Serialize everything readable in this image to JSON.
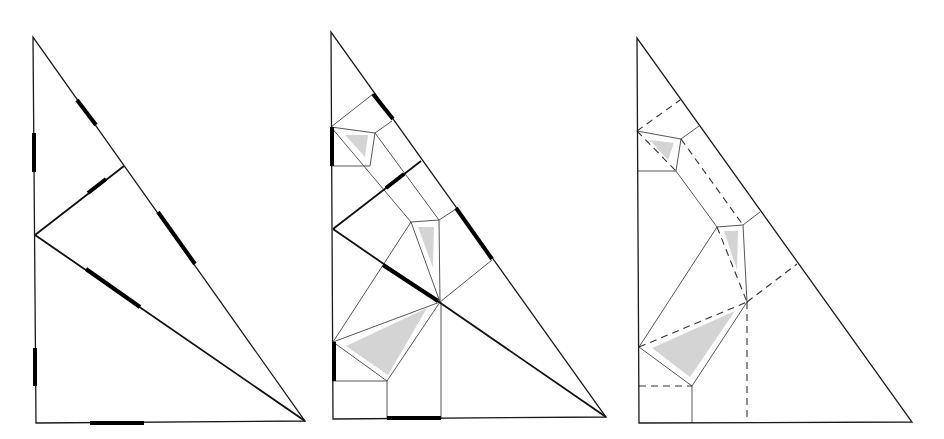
{
  "figure": {
    "colors": {
      "line": "#1a1a1a",
      "mark": "#000000",
      "shade": "#cfcfcf",
      "background": "#ffffff"
    },
    "panels": [
      {
        "id": "panel-1",
        "outline": [
          [
            33,
            37
          ],
          [
            36,
            423
          ],
          [
            305,
            421
          ]
        ],
        "edges": [
          [
            [
              35,
              235
            ],
            [
              124,
              166
            ]
          ],
          [
            [
              35,
              235
            ],
            [
              305,
              421
            ]
          ]
        ],
        "marks": [
          [
            [
              34,
              133
            ],
            [
              34,
              172
            ]
          ],
          [
            [
              35,
              348
            ],
            [
              35,
              386
            ]
          ],
          [
            [
              77,
              100
            ],
            [
              96,
              125
            ]
          ],
          [
            [
              158,
              212
            ],
            [
              195,
              264
            ]
          ],
          [
            [
              88,
              193
            ],
            [
              106,
              179
            ]
          ],
          [
            [
              86,
              269
            ],
            [
              140,
              307
            ]
          ],
          [
            [
              90,
              423
            ],
            [
              144,
              423
            ]
          ]
        ],
        "shades": [],
        "dashes": [],
        "creases": []
      },
      {
        "id": "panel-2",
        "outline": [
          [
            331,
            32
          ],
          [
            333,
            419
          ],
          [
            606,
            417
          ]
        ],
        "edges": [
          [
            [
              333,
              229
            ],
            [
              421,
              161
            ]
          ],
          [
            [
              333,
              229
            ],
            [
              606,
              417
            ]
          ]
        ],
        "creases": [
          [
            [
              331,
              127
            ],
            [
              373,
              94
            ]
          ],
          [
            [
              331,
              127
            ],
            [
              375,
              133
            ]
          ],
          [
            [
              375,
              133
            ],
            [
              370,
              166
            ]
          ],
          [
            [
              370,
              166
            ],
            [
              332,
              166
            ]
          ],
          [
            [
              375,
              133
            ],
            [
              392,
              121
            ]
          ],
          [
            [
              331,
              127
            ],
            [
              411,
              222
            ]
          ],
          [
            [
              375,
              133
            ],
            [
              439,
              220
            ]
          ],
          [
            [
              411,
              222
            ],
            [
              439,
              220
            ]
          ],
          [
            [
              439,
              220
            ],
            [
              440,
              302
            ]
          ],
          [
            [
              411,
              222
            ],
            [
              440,
              302
            ]
          ],
          [
            [
              439,
              220
            ],
            [
              456,
              209
            ]
          ],
          [
            [
              492,
              260
            ],
            [
              440,
              302
            ]
          ],
          [
            [
              411,
              222
            ],
            [
              333,
              342
            ]
          ],
          [
            [
              333,
              342
            ],
            [
              440,
              302
            ]
          ],
          [
            [
              333,
              342
            ],
            [
              387,
              381
            ]
          ],
          [
            [
              387,
              381
            ],
            [
              440,
              302
            ]
          ],
          [
            [
              333,
              381
            ],
            [
              387,
              381
            ]
          ],
          [
            [
              387,
              381
            ],
            [
              387,
              419
            ]
          ],
          [
            [
              441,
              302
            ],
            [
              441,
              419
            ]
          ]
        ],
        "marks": [
          [
            [
              373,
              94
            ],
            [
              393,
              119
            ]
          ],
          [
            [
              332,
              127
            ],
            [
              332,
              166
            ]
          ],
          [
            [
              386,
              188
            ],
            [
              404,
              174
            ]
          ],
          [
            [
              456,
              208
            ],
            [
              492,
              259
            ]
          ],
          [
            [
              383,
              265
            ],
            [
              438,
              301
            ]
          ],
          [
            [
              334,
              342
            ],
            [
              334,
              381
            ]
          ],
          [
            [
              387,
              418
            ],
            [
              441,
              418
            ]
          ]
        ],
        "shades": [
          [
            [
              345,
              135
            ],
            [
              368,
              135
            ],
            [
              365,
              157
            ]
          ],
          [
            [
              418,
              227
            ],
            [
              434,
              227
            ],
            [
              433,
              268
            ]
          ],
          [
            [
              346,
              346
            ],
            [
              427,
              308
            ],
            [
              388,
              375
            ]
          ]
        ],
        "dashes": []
      },
      {
        "id": "panel-3",
        "outline": [
          [
            637,
            38
          ],
          [
            639,
            423
          ],
          [
            912,
            422
          ]
        ],
        "edges": [],
        "creases": [
          [
            [
              637,
              131
            ],
            [
              681,
              139
            ]
          ],
          [
            [
              681,
              139
            ],
            [
              676,
              171
            ]
          ],
          [
            [
              676,
              171
            ],
            [
              637,
              171
            ]
          ],
          [
            [
              681,
              139
            ],
            [
              699,
              126
            ]
          ],
          [
            [
              676,
              171
            ],
            [
              717,
              227
            ]
          ],
          [
            [
              717,
              227
            ],
            [
              743,
              225
            ]
          ],
          [
            [
              743,
              225
            ],
            [
              747,
              302
            ]
          ],
          [
            [
              743,
              225
            ],
            [
              760,
              212
            ]
          ],
          [
            [
              717,
              227
            ],
            [
              639,
              347
            ]
          ],
          [
            [
              639,
              347
            ],
            [
              692,
              386
            ]
          ],
          [
            [
              692,
              386
            ],
            [
              747,
              302
            ]
          ],
          [
            [
              692,
              386
            ],
            [
              692,
              423
            ]
          ]
        ],
        "dashes": [
          [
            [
              637,
              131
            ],
            [
              680,
              100
            ]
          ],
          [
            [
              637,
              131
            ],
            [
              676,
              171
            ]
          ],
          [
            [
              681,
              139
            ],
            [
              743,
              225
            ]
          ],
          [
            [
              717,
              227
            ],
            [
              747,
              302
            ]
          ],
          [
            [
              747,
              302
            ],
            [
              797,
              264
            ]
          ],
          [
            [
              639,
              347
            ],
            [
              747,
              302
            ]
          ],
          [
            [
              639,
              386
            ],
            [
              692,
              386
            ]
          ],
          [
            [
              747,
              302
            ],
            [
              747,
              423
            ]
          ]
        ],
        "marks": [],
        "shades": [
          [
            [
              650,
              140
            ],
            [
              674,
              143
            ],
            [
              668,
              160
            ]
          ],
          [
            [
              724,
              231
            ],
            [
              738,
              231
            ],
            [
              737,
              270
            ]
          ],
          [
            [
              652,
              348
            ],
            [
              735,
              311
            ],
            [
              690,
              377
            ]
          ]
        ]
      }
    ]
  }
}
